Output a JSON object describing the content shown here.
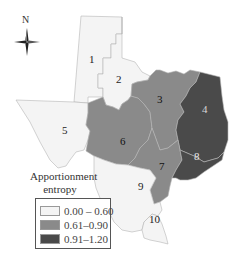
{
  "map": {
    "compass": {
      "label": "N",
      "icon": "compass-rose-icon"
    },
    "regions": [
      {
        "id": "1",
        "label": "1",
        "class": "low",
        "color": "#f4f4f4"
      },
      {
        "id": "2",
        "label": "2",
        "class": "low",
        "color": "#f4f4f4"
      },
      {
        "id": "3",
        "label": "3",
        "class": "mid",
        "color": "#8a8a8a"
      },
      {
        "id": "4",
        "label": "4",
        "class": "high",
        "color": "#4a4a4a"
      },
      {
        "id": "5",
        "label": "5",
        "class": "low",
        "color": "#f4f4f4"
      },
      {
        "id": "6",
        "label": "6",
        "class": "mid",
        "color": "#8a8a8a"
      },
      {
        "id": "7",
        "label": "7",
        "class": "mid",
        "color": "#8a8a8a"
      },
      {
        "id": "8",
        "label": "8",
        "class": "high",
        "color": "#4a4a4a"
      },
      {
        "id": "9",
        "label": "9",
        "class": "low",
        "color": "#f4f4f4"
      },
      {
        "id": "10",
        "label": "10",
        "class": "low",
        "color": "#f4f4f4"
      }
    ]
  },
  "legend": {
    "title_line1": "Apportionment",
    "title_line2": "entropy",
    "items": [
      {
        "label": "0.00 – 0.60",
        "color": "#f4f4f4"
      },
      {
        "label": "0.61–0.90",
        "color": "#8a8a8a"
      },
      {
        "label": "0.91–1.20",
        "color": "#4a4a4a"
      }
    ]
  }
}
